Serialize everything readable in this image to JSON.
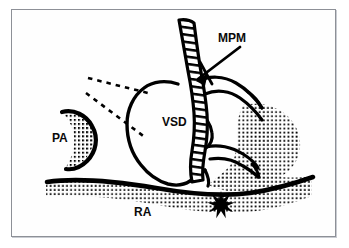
{
  "figure": {
    "background_color": "#ffffff",
    "ink_color": "#000000",
    "frame_color": "#8d9097",
    "frame_shadow_color": "#c9ccd2",
    "stipple_color": "#000000"
  },
  "labels": [
    {
      "id": "mpm",
      "text": "MPM",
      "meaning": "medial papillary muscle",
      "x": 218,
      "y": 42,
      "font_size": 12
    },
    {
      "id": "vsd",
      "text": "VSD",
      "meaning": "ventricular septal defect",
      "x": 162,
      "y": 126,
      "font_size": 12
    },
    {
      "id": "pa",
      "text": "PA",
      "meaning": "pulmonary artery",
      "x": 52,
      "y": 142,
      "font_size": 12
    },
    {
      "id": "ra",
      "text": "RA",
      "meaning": "right atrium",
      "x": 134,
      "y": 216,
      "font_size": 12
    }
  ],
  "markers": [
    {
      "id": "mpm-pointer-arrow",
      "type": "arrow-with-crossbar",
      "label_ref": "mpm",
      "tail_x": 240,
      "tail_y": 46,
      "tip_x": 196,
      "tip_y": 80
    },
    {
      "id": "defect-starburst",
      "type": "starburst",
      "points": 9,
      "center_x": 221,
      "center_y": 205,
      "outer_radius": 14,
      "inner_radius": 6,
      "fill": "#000000"
    }
  ],
  "regions": [
    {
      "id": "pa-crescent",
      "name": "pulmonary-artery-crescent",
      "fill": "stipple",
      "label_ref": "pa"
    },
    {
      "id": "septal-band",
      "name": "hatched-septal-band",
      "fill": "ladder-hatch"
    },
    {
      "id": "right-ventricle-mass",
      "name": "right-ventricular-stipple-mass",
      "fill": "stipple"
    },
    {
      "id": "ra-floor-band",
      "name": "right-atrium-floor-band",
      "fill": "stipple",
      "label_ref": "ra"
    },
    {
      "id": "vsd-chamber",
      "name": "ventricular-septal-defect-chamber",
      "fill": "none",
      "label_ref": "vsd"
    }
  ],
  "guide_lines": [
    {
      "id": "upper-sight-line",
      "style": "dashed",
      "from_x": 88,
      "from_y": 78,
      "to_x": 148,
      "to_y": 93
    },
    {
      "id": "lower-sight-line",
      "style": "dashed",
      "from_x": 86,
      "from_y": 93,
      "to_x": 146,
      "to_y": 138
    }
  ]
}
